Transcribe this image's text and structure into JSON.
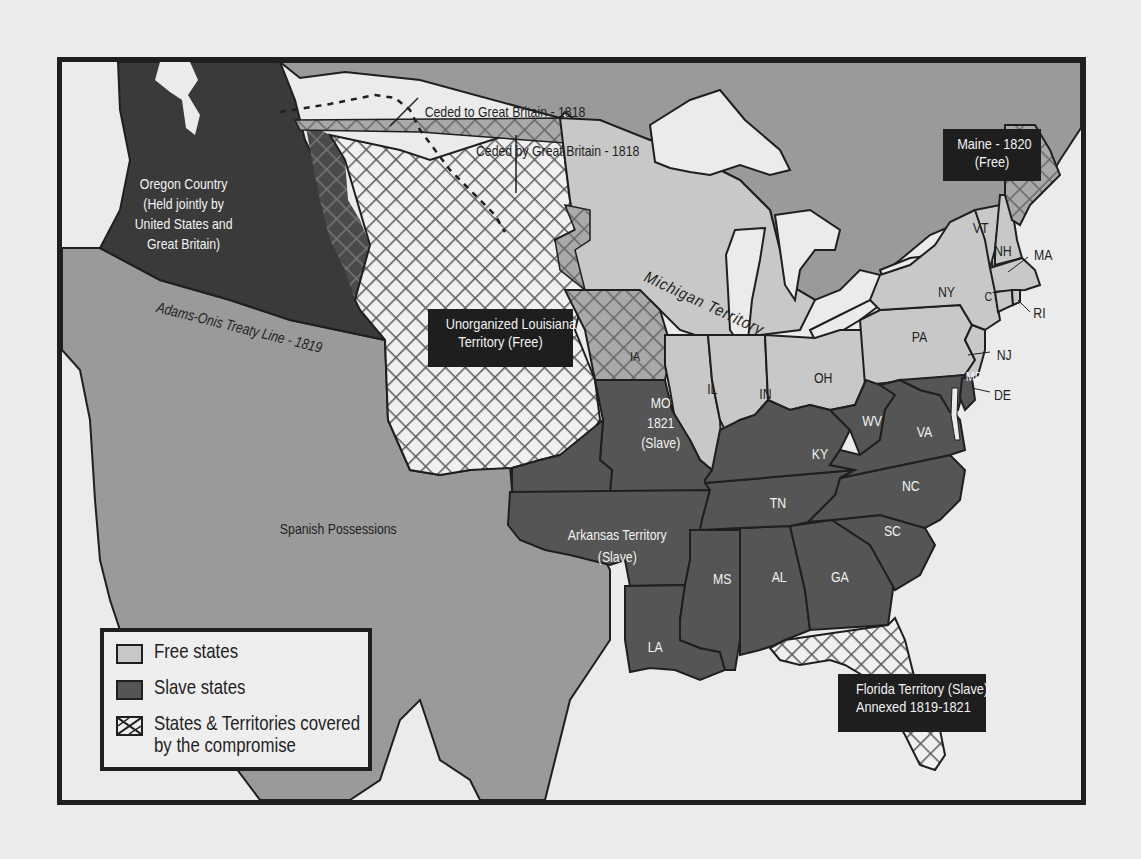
{
  "map": {
    "regions": {
      "oregon": {
        "line1": "Oregon Country",
        "line2": "(Held jointly by",
        "line3": "United States and",
        "line4": "Great Britain)"
      },
      "ceded_to": "Ceded to Great Britain - 1818",
      "ceded_by": "Ceded by Great Britain - 1818",
      "treaty_line": "Adams-Onis Treaty Line - 1819",
      "spanish": "Spanish Possessions",
      "michigan": "Michigan Territory",
      "louisiana": {
        "line1": "Unorganized Louisiana",
        "line2": "Territory (Free)"
      },
      "maine": {
        "line1": "Maine - 1820",
        "line2": "(Free)"
      },
      "missouri": {
        "line1": "MO",
        "line2": "1821",
        "line3": "(Slave)"
      },
      "arkansas": {
        "line1": "Arkansas Territory",
        "line2": "(Slave)"
      },
      "florida": {
        "line1": "Florida Territory (Slave)",
        "line2": "Annexed 1819-1821"
      }
    },
    "states": {
      "IA": "IA",
      "IL": "IL",
      "IN": "IN",
      "OH": "OH",
      "PA": "PA",
      "NY": "NY",
      "VT": "VT",
      "NH": "NH",
      "MA": "MA",
      "CT": "CT",
      "RI": "RI",
      "NJ": "NJ",
      "DE": "DE",
      "MD": "MD",
      "WV": "WV",
      "VA": "VA",
      "KY": "KY",
      "TN": "TN",
      "NC": "NC",
      "SC": "SC",
      "GA": "GA",
      "AL": "AL",
      "MS": "MS",
      "LA": "LA"
    },
    "colors": {
      "background": "#ebebeb",
      "foreign": "#9a9a9a",
      "free": "#c8c8c8",
      "slave": "#555555",
      "oregon": "#3a3a3a",
      "label_box": "#1e1e1e",
      "outline": "#1f1f1f"
    }
  },
  "legend": {
    "items": [
      {
        "label": "Free states",
        "swatch": "free"
      },
      {
        "label": "Slave states",
        "swatch": "slave"
      },
      {
        "label": "States & Territories covered",
        "label2": "by the compromise",
        "swatch": "hatched"
      }
    ]
  }
}
